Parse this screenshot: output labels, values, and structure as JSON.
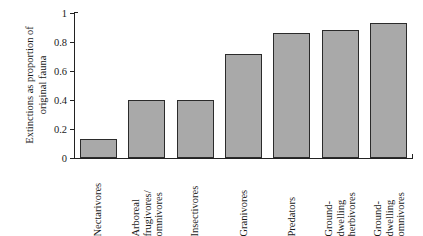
{
  "chart_data": {
    "type": "bar",
    "title": "",
    "xlabel": "",
    "ylabel_line1": "Extinctions as proportion of",
    "ylabel_line2": "original fauna",
    "ylabel": "Extinctions as proportion of original fauna",
    "ylim": [
      0,
      1
    ],
    "yticks": [
      "0",
      "0.2",
      "0.4",
      "0.6",
      "0.8",
      "1"
    ],
    "ytick_values": [
      0,
      0.2,
      0.4,
      0.6,
      0.8,
      1
    ],
    "grid": false,
    "legend": "none",
    "bar_color": "#a9a9a9",
    "bar_edge_color": "#2b2b2b",
    "categories": [
      "Nectarivores",
      "Arboreal frugivores/omnivores",
      "Insectivores",
      "Granivores",
      "Predators",
      "Ground-dwelling herbivores",
      "Ground-dwelling omnivores"
    ],
    "category_label_lines": [
      [
        "Nectarivores"
      ],
      [
        "Arboreal",
        "frugivores/",
        "omnivores"
      ],
      [
        "Insectivores"
      ],
      [
        "Granivores"
      ],
      [
        "Predators"
      ],
      [
        "Ground-",
        "dwelling",
        "herbivores"
      ],
      [
        "Ground-",
        "dwelling",
        "omnivores"
      ]
    ],
    "values": [
      0.13,
      0.4,
      0.4,
      0.72,
      0.86,
      0.88,
      0.93
    ]
  }
}
